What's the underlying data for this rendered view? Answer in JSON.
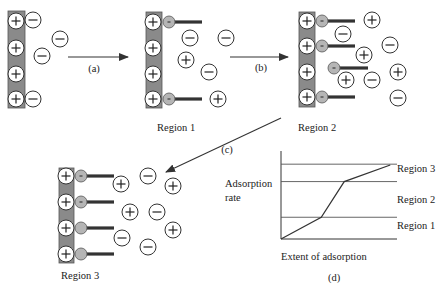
{
  "colors": {
    "electrode": "#8a8a8a",
    "ion_stroke": "#333333",
    "ion_fill": "#ffffff",
    "head_fill": "#b5b5b5",
    "tail": "#333333",
    "line": "#333333",
    "text": "#222222"
  },
  "steps": {
    "a": "(a)",
    "b": "(b)",
    "c": "(c)",
    "d": "(d)"
  },
  "panels": [
    {
      "id": "initial",
      "label": "",
      "electrode": {
        "x": 8,
        "y": 11,
        "w": 17,
        "h": 97
      },
      "surface_ions": [
        {
          "x": 16,
          "y": 21
        },
        {
          "x": 16,
          "y": 48
        },
        {
          "x": 16,
          "y": 74
        },
        {
          "x": 16,
          "y": 99
        }
      ],
      "surfactants": [],
      "ions": [
        {
          "x": 33,
          "y": 20,
          "sign": "−"
        },
        {
          "x": 60,
          "y": 39,
          "sign": "−"
        },
        {
          "x": 42,
          "y": 56,
          "sign": "−"
        },
        {
          "x": 33,
          "y": 99,
          "sign": "−"
        }
      ]
    },
    {
      "id": "region1",
      "label": "Region 1",
      "label_pos": {
        "x": 157,
        "y": 131
      },
      "electrode": {
        "x": 146,
        "y": 12,
        "w": 16,
        "h": 96
      },
      "surface_ions": [
        {
          "x": 153,
          "y": 22
        },
        {
          "x": 153,
          "y": 48
        },
        {
          "x": 153,
          "y": 74
        },
        {
          "x": 153,
          "y": 99
        }
      ],
      "surfactants": [
        {
          "hx": 169,
          "hy": 22,
          "tail_end": 202,
          "charged": true
        },
        {
          "hx": 169,
          "hy": 99,
          "tail_end": 202,
          "charged": true
        }
      ],
      "ions": [
        {
          "x": 190,
          "y": 38,
          "sign": "−"
        },
        {
          "x": 226,
          "y": 38,
          "sign": "−"
        },
        {
          "x": 186,
          "y": 60,
          "sign": "+"
        },
        {
          "x": 209,
          "y": 72,
          "sign": "−"
        },
        {
          "x": 218,
          "y": 99,
          "sign": "+"
        }
      ]
    },
    {
      "id": "region2",
      "label": "Region 2",
      "label_pos": {
        "x": 298,
        "y": 131
      },
      "electrode": {
        "x": 299,
        "y": 12,
        "w": 16,
        "h": 95
      },
      "surface_ions": [
        {
          "x": 307,
          "y": 21
        },
        {
          "x": 307,
          "y": 46
        },
        {
          "x": 307,
          "y": 72
        },
        {
          "x": 307,
          "y": 97
        }
      ],
      "surfactants": [
        {
          "hx": 322,
          "hy": 21,
          "tail_end": 355,
          "charged": true
        },
        {
          "hx": 322,
          "hy": 46,
          "tail_end": 355,
          "charged": true
        },
        {
          "hx": 334,
          "hy": 68,
          "tail_end": 368,
          "charged": true
        },
        {
          "hx": 322,
          "hy": 97,
          "tail_end": 355,
          "charged": true
        }
      ],
      "ions": [
        {
          "x": 372,
          "y": 20,
          "sign": "+"
        },
        {
          "x": 343,
          "y": 34,
          "sign": "−"
        },
        {
          "x": 390,
          "y": 45,
          "sign": "−"
        },
        {
          "x": 364,
          "y": 55,
          "sign": "+"
        },
        {
          "x": 398,
          "y": 72,
          "sign": "+"
        },
        {
          "x": 346,
          "y": 80,
          "sign": "+"
        },
        {
          "x": 372,
          "y": 80,
          "sign": "−"
        },
        {
          "x": 398,
          "y": 98,
          "sign": "−"
        }
      ]
    },
    {
      "id": "region3",
      "label": "Region 3",
      "label_pos": {
        "x": 61,
        "y": 279
      },
      "electrode": {
        "x": 59,
        "y": 168,
        "w": 15,
        "h": 95
      },
      "surface_ions": [
        {
          "x": 66,
          "y": 176
        },
        {
          "x": 66,
          "y": 202
        },
        {
          "x": 66,
          "y": 228
        },
        {
          "x": 66,
          "y": 254
        }
      ],
      "surfactants": [
        {
          "hx": 81,
          "hy": 176,
          "tail_end": 114,
          "charged": true
        },
        {
          "hx": 81,
          "hy": 202,
          "tail_end": 114,
          "charged": true
        },
        {
          "hx": 81,
          "hy": 228,
          "tail_end": 114,
          "charged": false
        },
        {
          "hx": 81,
          "hy": 254,
          "tail_end": 114,
          "charged": false
        }
      ],
      "ions": [
        {
          "x": 121,
          "y": 184,
          "sign": "+"
        },
        {
          "x": 148,
          "y": 176,
          "sign": "−"
        },
        {
          "x": 173,
          "y": 186,
          "sign": "+"
        },
        {
          "x": 130,
          "y": 212,
          "sign": "+"
        },
        {
          "x": 157,
          "y": 212,
          "sign": "−"
        },
        {
          "x": 173,
          "y": 230,
          "sign": "+"
        },
        {
          "x": 122,
          "y": 238,
          "sign": "−"
        },
        {
          "x": 148,
          "y": 247,
          "sign": "−"
        }
      ]
    }
  ],
  "arrows": [
    {
      "id": "a",
      "x1": 68,
      "y1": 57,
      "x2": 128,
      "y2": 57,
      "label": "(a)",
      "lx": 94,
      "ly": 72
    },
    {
      "id": "b",
      "x1": 230,
      "y1": 57,
      "x2": 288,
      "y2": 57,
      "label": "(b)",
      "lx": 261,
      "ly": 71
    },
    {
      "id": "c",
      "x1": 281,
      "y1": 118,
      "x2": 166,
      "y2": 172,
      "label": "(c)",
      "lx": 227,
      "ly": 153
    }
  ],
  "chart_data": {
    "type": "line",
    "title": "",
    "xlabel": "Extent of adsorption",
    "ylabel": "Adsorption rate",
    "panel_label": "(d)",
    "grid": false,
    "legend": null,
    "series": [
      {
        "name": "adsorption",
        "x": [
          0,
          0.35,
          0.55,
          0.95
        ],
        "y": [
          0,
          0.25,
          0.66,
          0.85
        ]
      }
    ],
    "region_boundaries_y": [
      0.25,
      0.66,
      0.86
    ],
    "region_labels": [
      "Region 1",
      "Region 2",
      "Region 3"
    ],
    "xlim": [
      0,
      1
    ],
    "ylim": [
      0,
      1
    ]
  }
}
